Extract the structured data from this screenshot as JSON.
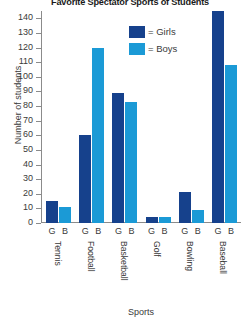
{
  "chart_data": {
    "type": "bar",
    "title": "Favorite Spectator Sports of Students",
    "xlabel": "Sports",
    "ylabel": "Number of students",
    "categories": [
      "Tennis",
      "Football",
      "Basketball",
      "Golf",
      "Bowling",
      "Baseball"
    ],
    "group_labels": [
      "G",
      "B"
    ],
    "series": [
      {
        "name": "Girls",
        "color": "#16418c",
        "values": [
          15,
          60,
          89,
          4,
          21,
          145
        ]
      },
      {
        "name": "Boys",
        "color": "#1b9ad6",
        "values": [
          11,
          120,
          83,
          4,
          9,
          108
        ]
      }
    ],
    "ylim": [
      0,
      145
    ],
    "yticks": [
      0,
      10,
      20,
      30,
      40,
      50,
      60,
      70,
      80,
      90,
      100,
      110,
      120,
      130,
      140
    ],
    "grid": false,
    "legend": {
      "position": "top-center",
      "entries": [
        {
          "label": "= Girls",
          "color": "#16418c"
        },
        {
          "label": "= Boys",
          "color": "#1b9ad6"
        }
      ]
    }
  }
}
